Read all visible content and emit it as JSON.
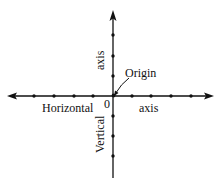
{
  "diagram": {
    "colors": {
      "ink": "#111111",
      "background": "#ffffff"
    },
    "origin": {
      "x": 113,
      "y": 96
    },
    "horizontal_axis": {
      "x_start": 8,
      "x_end": 213,
      "ticks_left": [
        34,
        54,
        74,
        93
      ],
      "ticks_right": [
        132,
        151,
        171,
        191
      ]
    },
    "vertical_axis": {
      "y_start": 12,
      "y_end": 178,
      "ticks_up": [
        35,
        56,
        76
      ],
      "ticks_down": [
        116,
        136,
        156
      ]
    },
    "labels": {
      "origin_label": "Origin",
      "zero_label": "0",
      "horizontal_left": "Horizontal",
      "horizontal_right": "axis",
      "vertical_up": "axis",
      "vertical_down": "Vertical"
    }
  }
}
